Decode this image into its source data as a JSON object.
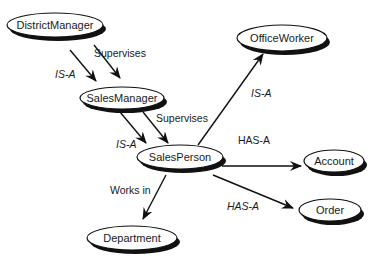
{
  "diagram": {
    "colors": {
      "ink": "#111111",
      "fill": "#ffffff",
      "shadow": "#111111"
    },
    "nodes": [
      {
        "id": "district_manager",
        "label": "DistrictManager",
        "cx": 55,
        "cy": 25,
        "rx": 48,
        "ry": 12
      },
      {
        "id": "sales_manager",
        "label": "SalesManager",
        "cx": 122,
        "cy": 98,
        "rx": 42,
        "ry": 11
      },
      {
        "id": "sales_person",
        "label": "SalesPerson",
        "cx": 180,
        "cy": 157,
        "rx": 43,
        "ry": 12
      },
      {
        "id": "office_worker",
        "label": "OfficeWorker",
        "cx": 282,
        "cy": 38,
        "rx": 45,
        "ry": 13
      },
      {
        "id": "account",
        "label": "Account",
        "cx": 334,
        "cy": 161,
        "rx": 30,
        "ry": 11
      },
      {
        "id": "order",
        "label": "Order",
        "cx": 330,
        "cy": 210,
        "rx": 31,
        "ry": 11
      },
      {
        "id": "department",
        "label": "Department",
        "cx": 132,
        "cy": 238,
        "rx": 45,
        "ry": 12
      }
    ],
    "edges": [
      {
        "id": "dm_isa_sm",
        "from": "district_manager",
        "to": "sales_manager",
        "label": "IS-A",
        "italic": true,
        "x1": 70,
        "y1": 50,
        "x2": 96,
        "y2": 81,
        "lx": 55,
        "ly": 78
      },
      {
        "id": "dm_sup_sm",
        "from": "district_manager",
        "to": "sales_manager",
        "label": "Supervises",
        "italic": false,
        "x1": 94,
        "y1": 45,
        "x2": 120,
        "y2": 78,
        "lx": 94,
        "ly": 57
      },
      {
        "id": "sm_isa_sp",
        "from": "sales_manager",
        "to": "sales_person",
        "label": "IS-A",
        "italic": true,
        "x1": 120,
        "y1": 112,
        "x2": 146,
        "y2": 143,
        "lx": 116,
        "ly": 148
      },
      {
        "id": "sm_sup_sp",
        "from": "sales_manager",
        "to": "sales_person",
        "label": "Supervises",
        "italic": false,
        "x1": 143,
        "y1": 112,
        "x2": 168,
        "y2": 143,
        "lx": 156,
        "ly": 122
      },
      {
        "id": "sp_isa_ow",
        "from": "sales_person",
        "to": "office_worker",
        "label": "IS-A",
        "italic": true,
        "x1": 198,
        "y1": 145,
        "x2": 263,
        "y2": 54,
        "lx": 251,
        "ly": 97
      },
      {
        "id": "sp_hasa_acc",
        "from": "sales_person",
        "to": "account",
        "label": "HAS-A",
        "italic": false,
        "x1": 222,
        "y1": 166,
        "x2": 301,
        "y2": 166,
        "lx": 238,
        "ly": 144
      },
      {
        "id": "sp_hasa_ord",
        "from": "sales_person",
        "to": "order",
        "label": "HAS-A",
        "italic": true,
        "x1": 213,
        "y1": 175,
        "x2": 293,
        "y2": 208,
        "lx": 227,
        "ly": 210
      },
      {
        "id": "sp_works_dept",
        "from": "sales_person",
        "to": "department",
        "label": "Works in",
        "italic": false,
        "x1": 166,
        "y1": 175,
        "x2": 143,
        "y2": 219,
        "lx": 110,
        "ly": 194
      }
    ]
  }
}
